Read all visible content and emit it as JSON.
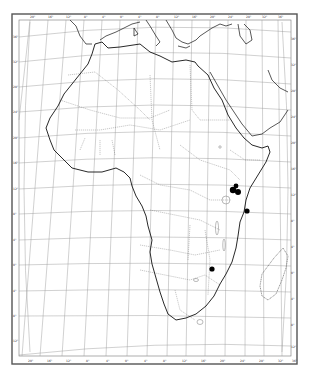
{
  "map": {
    "title": "Africa distribution map",
    "frame": {
      "outer": [
        12,
        14,
        297,
        364
      ],
      "inner": [
        19,
        20,
        291,
        356
      ]
    },
    "top_ticks": [
      "20°",
      "16°",
      "12°",
      "8°",
      "4°",
      "0°",
      "4°",
      "8°",
      "12°",
      "16°",
      "20°",
      "24°",
      "28°",
      "32°",
      "36°",
      "40°",
      "44°",
      "48°"
    ],
    "bottom_ticks": [
      "20°",
      "16°",
      "12°",
      "8°",
      "4°",
      "0°",
      "4°",
      "8°",
      "12°",
      "16°",
      "20°",
      "24°",
      "28°",
      "32°",
      "36°",
      "40°"
    ],
    "left_ticks": [
      "36°",
      "32°",
      "28°",
      "24°",
      "20°",
      "16°",
      "12°",
      "8°",
      "4°",
      "0°",
      "4°",
      "8°",
      "12°",
      "16°",
      "20°",
      "24°",
      "28°",
      "32°"
    ],
    "right_ticks": [
      "36°",
      "32°",
      "28°",
      "24°",
      "20°",
      "16°",
      "12°",
      "8°",
      "4°",
      "0°",
      "4°",
      "8°",
      "12°",
      "16°",
      "20°",
      "24°",
      "28°",
      "32°"
    ],
    "markers": [
      {
        "label": "Kenya highlands A",
        "x": 233,
        "y": 190,
        "r": 3.2
      },
      {
        "label": "Kenya highlands B",
        "x": 238,
        "y": 192,
        "r": 3.0
      },
      {
        "label": "Kenya highlands C",
        "x": 236,
        "y": 186,
        "r": 2.4
      },
      {
        "label": "Coastal Kenya",
        "x": 247,
        "y": 211,
        "r": 2.6
      },
      {
        "label": "Mozambique/Zimbabwe",
        "x": 212,
        "y": 269,
        "r": 2.6
      }
    ],
    "colors": {
      "coast": "#111111",
      "border": "#777777",
      "grid": "#999999",
      "frame": "#555555",
      "marker": "#000000"
    }
  }
}
